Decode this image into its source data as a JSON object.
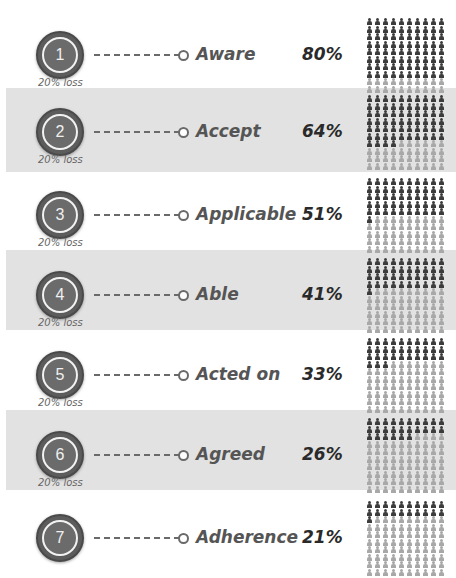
{
  "colors": {
    "band": "#e2e2e2",
    "circle": "#5c5c5c",
    "icon_filled": "#3c3c3c",
    "icon_empty": "#a8a8a8",
    "stage_text": "#555555",
    "percent_text": "#2a2a2a"
  },
  "loss_label": "20% loss",
  "stages": [
    {
      "number": "1",
      "label": "Aware",
      "percent": "80%",
      "value": 80,
      "loss": "20% loss"
    },
    {
      "number": "2",
      "label": "Accept",
      "percent": "64%",
      "value": 64,
      "loss": "20% loss"
    },
    {
      "number": "3",
      "label": "Applicable",
      "percent": "51%",
      "value": 51,
      "loss": "20% loss"
    },
    {
      "number": "4",
      "label": "Able",
      "percent": "41%",
      "value": 41,
      "loss": "20% loss"
    },
    {
      "number": "5",
      "label": "Acted on",
      "percent": "33%",
      "value": 33,
      "loss": "20% loss"
    },
    {
      "number": "6",
      "label": "Agreed",
      "percent": "26%",
      "value": 26,
      "loss": "20% loss"
    },
    {
      "number": "7",
      "label": "Adherence",
      "percent": "21%",
      "value": 21,
      "loss": null
    }
  ],
  "icon_grid": {
    "columns": 10,
    "rows": 10,
    "icon": "person-icon"
  }
}
